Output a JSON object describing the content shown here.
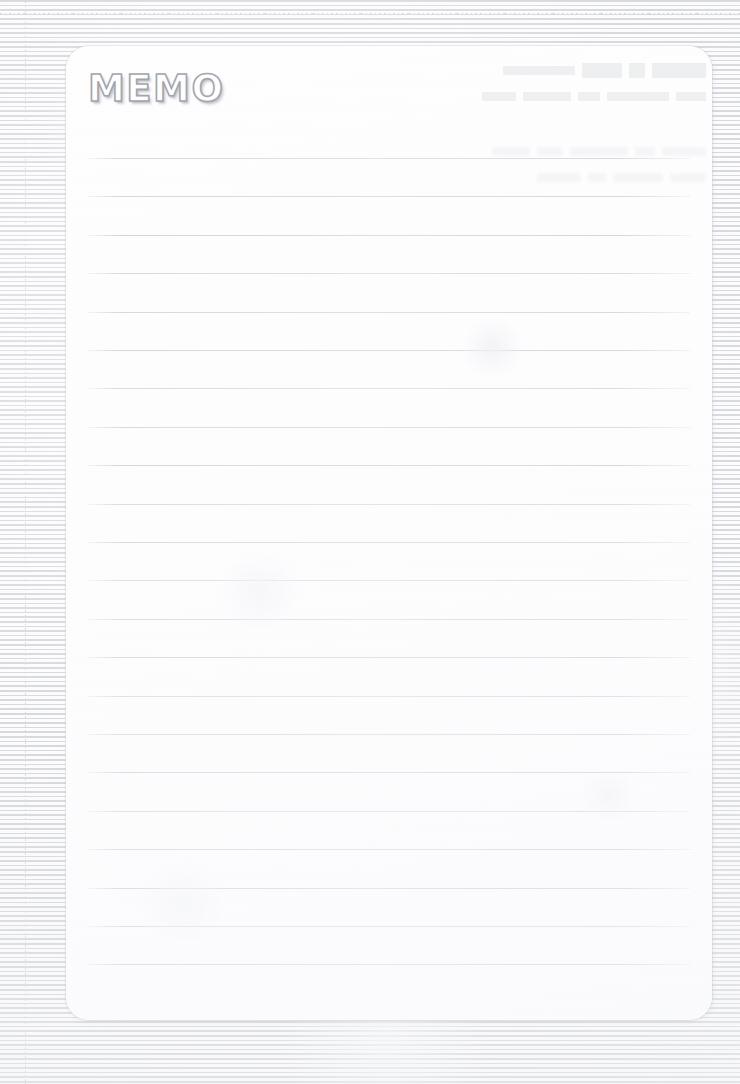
{
  "page": {
    "kind": "scanned-memo-sheet",
    "width": 740,
    "height": 1084,
    "background_description": "graph / grid paper",
    "colors": {
      "page_background": "#fcfcfd",
      "grid_line": "#c9ccd2",
      "card_paper": "#fefeff",
      "card_border": "#cdd0d6",
      "rule_line": "#c8cbd2",
      "title_fill": "#ffffff",
      "title_outline": "#9ea3ab",
      "title_shadow": "#969aa2"
    }
  },
  "grid": {
    "name": "graph-paper-grid",
    "cell_size_px": 48,
    "line_style": "dotted",
    "offset_x_px": 25,
    "offset_y_px": 13
  },
  "memo_card": {
    "name": "memo-card",
    "left": 66,
    "top": 46,
    "width": 646,
    "height": 974,
    "corner_radius": 23
  },
  "header": {
    "title": "MEMO",
    "style": "outlined-hollow-bold-rounded",
    "left": 22,
    "top": 24,
    "font_size": 37
  },
  "ruled_lines": {
    "name": "ruled-lines",
    "count": 22,
    "first_line_y": 112,
    "spacing_px": 38.4,
    "left_inset": 22,
    "right_inset": 22,
    "line_width": 602,
    "y_positions": [
      112,
      150.4,
      188.8,
      227.2,
      265.6,
      304,
      342.4,
      380.8,
      419.2,
      457.6,
      496,
      534.4,
      572.8,
      611.2,
      649.6,
      688,
      726.4,
      764.8,
      803.2,
      841.6,
      880,
      918.4
    ]
  },
  "ghost_bleed": {
    "name": "bleed-through-text",
    "legible": false,
    "description": "faint mirrored show-through from the reverse side of the sheet",
    "rows": [
      {
        "bands": [
          54,
          16,
          40,
          72
        ]
      },
      {
        "bands": [
          30,
          62,
          22,
          48,
          34
        ]
      },
      {
        "bands": [
          44,
          20,
          58,
          26,
          38
        ]
      },
      {
        "bands": [
          36,
          50,
          18,
          44
        ]
      }
    ]
  },
  "content": {
    "body_text": "",
    "note": "sheet is blank — no handwriting or printed body content"
  }
}
